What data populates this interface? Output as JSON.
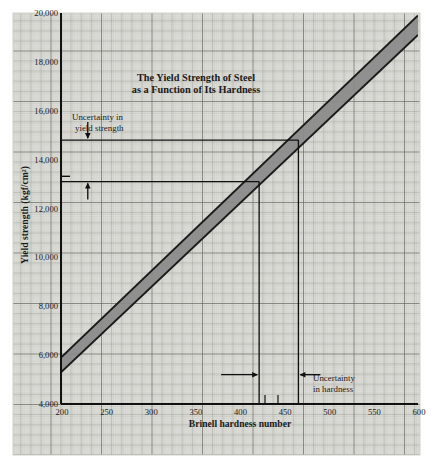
{
  "figure": {
    "caption_title_line1": "The Yield Strength of Steel",
    "caption_title_line2": "as a Function of Its Hardness",
    "annotation_yield_line1": "Uncertainty in",
    "annotation_yield_line2": "yield strength",
    "annotation_hardness_line1": "Uncertainty",
    "annotation_hardness_line2": "in hardness",
    "xlabel": "Brinell hardness number",
    "ylabel": "Yield strength (kgf/cm²)",
    "paper_color": "#e8e8e4",
    "grid_color": "#8c8c8c",
    "band_fill": "#8a8a8a",
    "band_edge": "#1a1a1a",
    "axis_color": "#111111"
  },
  "chart_data": {
    "type": "area",
    "title": "The Yield Strength of Steel as a Function of Its Hardness",
    "xlabel": "Brinell hardness number",
    "ylabel": "Yield strength (kgf/cm²)",
    "xlim": [
      200,
      600
    ],
    "ylim": [
      4000,
      20000
    ],
    "xticks": [
      200,
      250,
      300,
      350,
      400,
      450,
      500,
      550,
      600
    ],
    "xticklabels": [
      "200",
      "250",
      "300",
      "350",
      "400",
      "450",
      "500",
      "550",
      "600"
    ],
    "yticks": [
      4000,
      6000,
      8000,
      10000,
      12000,
      14000,
      16000,
      18000,
      20000
    ],
    "yticklabels": [
      "4,000",
      "6,000",
      "8,000",
      "10,000",
      "12,000",
      "14,000",
      "16,000",
      "18,000",
      "20,000"
    ],
    "grid": true,
    "grid_minor": true,
    "legend": "none",
    "series": [
      {
        "name": "Yield strength band (lower bound)",
        "x": [
          200,
          600
        ],
        "values": [
          5300,
          19100
        ]
      },
      {
        "name": "Yield strength band (upper bound)",
        "x": [
          200,
          600
        ],
        "values": [
          5900,
          19900
        ]
      }
    ],
    "annotations": [
      {
        "name": "uncertainty-in-yield-strength",
        "text": "Uncertainty in yield strength",
        "type": "double-arrow-vertical",
        "x": 230,
        "y_from": 14800,
        "y_to": 13100
      },
      {
        "name": "uncertainty-in-hardness",
        "text": "Uncertainty in hardness",
        "type": "double-arrow-horizontal",
        "y": 5200,
        "x_from": 422,
        "x_to": 466
      },
      {
        "name": "upper-construction-line",
        "type": "hline",
        "y": 14800,
        "x_from": 200,
        "x_to": 466
      },
      {
        "name": "lower-construction-line",
        "type": "hline",
        "y": 13100,
        "x_from": 200,
        "x_to": 422
      },
      {
        "name": "upper-drop-line",
        "type": "vline",
        "x": 466,
        "y_from": 14800,
        "y_to": 4000
      },
      {
        "name": "lower-drop-line",
        "type": "vline",
        "x": 422,
        "y_from": 13100,
        "y_to": 4000
      }
    ]
  }
}
